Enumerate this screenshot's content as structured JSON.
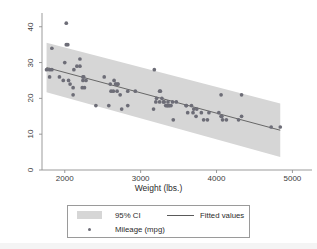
{
  "chart_data": {
    "type": "scatter",
    "title": "",
    "subtitle": "",
    "xlabel": "Weight (lbs.)",
    "ylabel": "",
    "xlim": [
      1700,
      5100
    ],
    "ylim": [
      0,
      43
    ],
    "xticks": [
      2000,
      3000,
      4000,
      5000
    ],
    "yticks": [
      0,
      10,
      20,
      30,
      40
    ],
    "grid": false,
    "legend_position": "bottom",
    "legend": [
      {
        "label": "95% CI",
        "key": "band",
        "color": "#d6d6d6"
      },
      {
        "label": "Fitted values",
        "key": "line",
        "color": "#5a5a5a"
      },
      {
        "label": "Mileage (mpg)",
        "key": "marker",
        "color": "#6d6d77"
      }
    ],
    "series": [
      {
        "name": "Mileage (mpg)",
        "type": "scatter",
        "marker_color": "#6d6d77",
        "x": [
          1760,
          1800,
          1800,
          1830,
          1830,
          1930,
          1980,
          2000,
          2020,
          2020,
          2040,
          2050,
          2070,
          2110,
          2110,
          2120,
          2160,
          2200,
          2200,
          2230,
          2240,
          2240,
          2250,
          2260,
          2280,
          2410,
          2520,
          2580,
          2600,
          2610,
          2640,
          2650,
          2670,
          2670,
          2690,
          2700,
          2700,
          2730,
          2750,
          2830,
          2830,
          2930,
          3170,
          3180,
          3200,
          3210,
          3250,
          3250,
          3260,
          3280,
          3300,
          3310,
          3330,
          3350,
          3350,
          3360,
          3370,
          3380,
          3400,
          3420,
          3430,
          3470,
          3600,
          3600,
          3620,
          3670,
          3690,
          3700,
          3730,
          3740,
          3800,
          3830,
          3880,
          3900,
          4030,
          4060,
          4060,
          4070,
          4080,
          4130,
          4290,
          4330,
          4330,
          4720,
          4840
        ],
        "y": [
          28,
          28,
          26,
          34,
          28,
          26,
          25,
          30,
          41,
          35,
          35,
          25,
          24,
          23,
          21,
          28,
          29,
          29,
          31,
          23,
          26,
          25,
          26,
          23,
          25,
          18,
          26,
          18,
          24,
          22,
          22,
          25,
          24,
          24,
          22,
          24,
          24,
          21,
          17,
          22,
          18,
          22,
          17,
          28,
          19,
          20,
          22,
          19,
          22,
          20,
          19,
          19,
          18,
          18,
          18,
          19,
          18,
          18,
          18,
          19,
          14,
          19,
          18,
          18,
          16,
          18,
          16,
          17,
          15,
          17,
          16,
          14,
          14,
          16,
          16,
          21,
          15,
          15,
          14,
          14,
          14,
          21,
          15,
          12,
          12
        ]
      },
      {
        "name": "Fitted values",
        "type": "line",
        "color": "#5a5a5a",
        "x": [
          1760,
          4840
        ],
        "y": [
          28.6,
          11.1
        ]
      },
      {
        "name": "95% CI",
        "type": "band",
        "color": "#d6d6d6",
        "x": [
          1760,
          4840
        ],
        "y_upper": [
          35.5,
          18.6
        ],
        "y_lower": [
          21.7,
          3.6
        ]
      }
    ]
  },
  "axes": {
    "x_title": "Weight (lbs.)",
    "x_tick_labels": [
      "2000",
      "3000",
      "4000",
      "5000"
    ],
    "y_tick_labels": [
      "0",
      "10",
      "20",
      "30",
      "40"
    ]
  },
  "legend_labels": {
    "ci": "95% CI",
    "fitted": "Fitted values",
    "mileage": "Mileage (mpg)"
  },
  "colors": {
    "marker": "#6d6d77",
    "band": "#d6d6d6",
    "line": "#5a5a5a",
    "axis": "#8c8c8c",
    "background": "#ffffff",
    "legend_border": "#9a9a9a"
  }
}
